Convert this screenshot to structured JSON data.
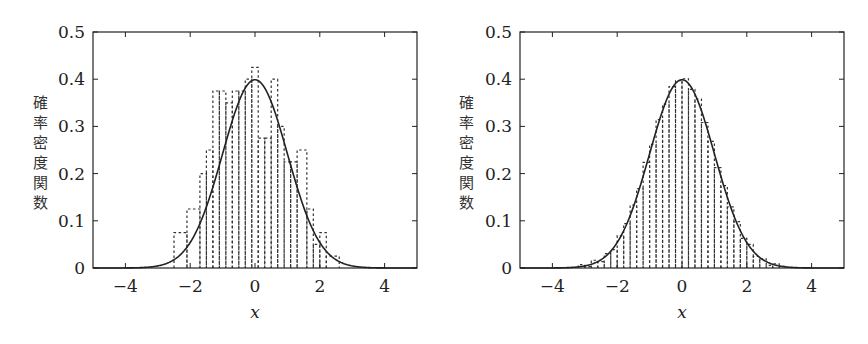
{
  "chart_data": [
    {
      "type": "bar",
      "subtype": "histogram_with_density_curve",
      "title": "",
      "xlabel": "x",
      "ylabel": "確率密度関数",
      "xlim": [
        -5,
        5
      ],
      "ylim": [
        0,
        0.5
      ],
      "xticks": [
        -4,
        -2,
        0,
        2,
        4
      ],
      "xtick_labels": [
        "−4",
        "−2",
        "0",
        "2",
        "4"
      ],
      "yticks": [
        0,
        0.1,
        0.2,
        0.3,
        0.4,
        0.5
      ],
      "ytick_labels": [
        "0",
        "0.1",
        "0.2",
        "0.3",
        "0.4",
        "0.5"
      ],
      "grid": false,
      "legend": "none",
      "curve": {
        "name": "normal pdf",
        "mean": 0,
        "std": 1
      },
      "histogram": {
        "bin_edges": [
          -2.5,
          -2.1,
          -1.7,
          -1.5,
          -1.3,
          -1.1,
          -0.9,
          -0.7,
          -0.5,
          -0.3,
          -0.1,
          0.1,
          0.3,
          0.5,
          0.7,
          0.9,
          1.1,
          1.3,
          1.6,
          1.8,
          2.0,
          2.2,
          2.6
        ],
        "values": [
          0.075,
          0.125,
          0.2,
          0.25,
          0.375,
          0.375,
          0.35,
          0.375,
          0.375,
          0.4,
          0.425,
          0.275,
          0.275,
          0.4,
          0.3,
          0.225,
          0.225,
          0.25,
          0.125,
          0.05,
          0.075,
          0.025
        ]
      }
    },
    {
      "type": "bar",
      "subtype": "histogram_with_density_curve",
      "title": "",
      "xlabel": "x",
      "ylabel": "確率密度関数",
      "xlim": [
        -5,
        5
      ],
      "ylim": [
        0,
        0.5
      ],
      "xticks": [
        -4,
        -2,
        0,
        2,
        4
      ],
      "xtick_labels": [
        "−4",
        "−2",
        "0",
        "2",
        "4"
      ],
      "yticks": [
        0,
        0.1,
        0.2,
        0.3,
        0.4,
        0.5
      ],
      "ytick_labels": [
        "0",
        "0.1",
        "0.2",
        "0.3",
        "0.4",
        "0.5"
      ],
      "grid": false,
      "legend": "none",
      "curve": {
        "name": "normal pdf",
        "mean": 0,
        "std": 1
      },
      "histogram": {
        "bin_start": -3.2,
        "bin_width": 0.2,
        "bin_count": 32,
        "follows": "normal pdf (fine bins, close fit)"
      }
    }
  ]
}
